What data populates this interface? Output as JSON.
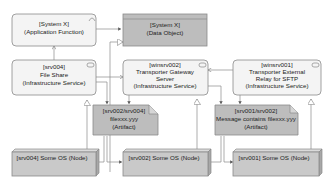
{
  "colors": {
    "app_fill": "#f4f4f4",
    "object_fill": "#bdbdbd",
    "artifact_fill": "#bdbdbd",
    "node_fill": "#c9c9c9",
    "node_side": "#a8a8a8",
    "stroke": "#7a7a7a",
    "line": "#888888"
  },
  "elements": {
    "app_function": {
      "lines": [
        "[System X]",
        "(Application Function)"
      ]
    },
    "data_object": {
      "lines": [
        "[System X]",
        "(Data Object)"
      ]
    },
    "file_share": {
      "lines": [
        "[srv004]",
        "File Share",
        "(Infrastructure Service)"
      ]
    },
    "gateway": {
      "lines": [
        "[winsrv002]",
        "Transporter Gateway",
        "Server",
        "(Infrastructure Service)"
      ]
    },
    "relay": {
      "lines": [
        "[winsrv001]",
        "Transporter External",
        "Relay for SFTP",
        "(Infrastructure Service)"
      ]
    },
    "artifact_1": {
      "lines": [
        "[srv002/srv004]",
        "filexxx.yyy",
        "(Artifact)"
      ]
    },
    "artifact_2": {
      "lines": [
        "[srv001/srv002]",
        "Message contains filexxx.yyy",
        "(Artifact)"
      ]
    },
    "node_1": {
      "lines": [
        "[srv004] Some OS (Node)"
      ]
    },
    "node_2": {
      "lines": [
        "[srv002] Some OS (Node)"
      ]
    },
    "node_3": {
      "lines": [
        "[srv001] Some OS (Node)"
      ]
    }
  }
}
